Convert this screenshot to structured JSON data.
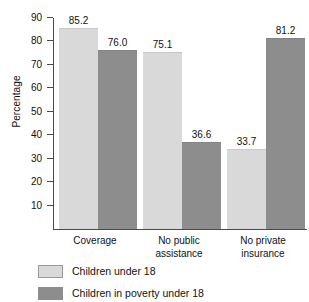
{
  "chart_data": {
    "type": "bar",
    "title": "",
    "xlabel": "",
    "ylabel": "Percentage",
    "ylim": [
      0,
      90
    ],
    "ytick_step": 10,
    "yticks": [
      90,
      80,
      70,
      60,
      50,
      40,
      30,
      20,
      10
    ],
    "grid": false,
    "legend_position": "bottom-left",
    "categories": [
      "Coverage",
      "No public assistance",
      "No private insurance"
    ],
    "category_lines": [
      [
        "Coverage"
      ],
      [
        "No public",
        "assistance"
      ],
      [
        "No private",
        "insurance"
      ]
    ],
    "series": [
      {
        "name": "Children under 18",
        "color": "#d9d9d9",
        "values": [
          85.2,
          75.1,
          33.7
        ],
        "labels": [
          "85.2",
          "75.1",
          "33.7"
        ]
      },
      {
        "name": "Children in poverty under 18",
        "color": "#8d8d8d",
        "values": [
          76.0,
          36.6,
          81.2
        ],
        "labels": [
          "76.0",
          "36.6",
          "81.2"
        ]
      }
    ]
  },
  "axis": {
    "y_title": "Percentage",
    "y_tick_labels": [
      "90",
      "80",
      "70",
      "60",
      "50",
      "40",
      "30",
      "20",
      "10"
    ]
  },
  "legend": {
    "entries": [
      {
        "label": "Children under 18"
      },
      {
        "label": "Children in poverty under 18"
      }
    ]
  }
}
